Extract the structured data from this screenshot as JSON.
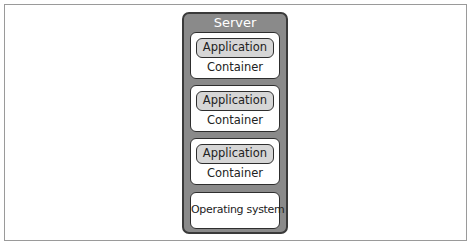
{
  "diagram": {
    "server": {
      "title": "Server",
      "containers": [
        {
          "application": "Application",
          "label": "Container"
        },
        {
          "application": "Application",
          "label": "Container"
        },
        {
          "application": "Application",
          "label": "Container"
        }
      ],
      "os": "Operating system"
    },
    "colors": {
      "server_fill": "#8a8a8a",
      "server_border": "#3a3a3a",
      "container_fill": "#ffffff",
      "application_fill": "#d6d6d6"
    }
  }
}
